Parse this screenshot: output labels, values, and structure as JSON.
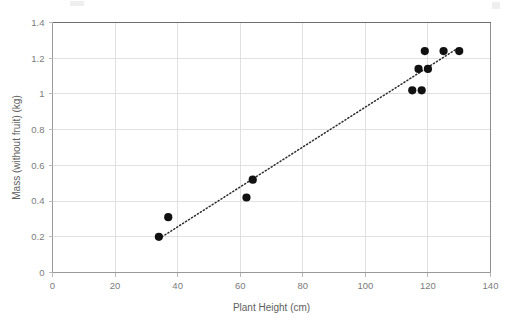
{
  "chart_data": {
    "type": "scatter",
    "title": "",
    "xlabel": "Plant Height (cm)",
    "ylabel": "Mass (without fruit) (kg)",
    "xlim": [
      0,
      140
    ],
    "ylim": [
      0,
      1.4
    ],
    "xticks": [
      "0",
      "20",
      "40",
      "60",
      "80",
      "100",
      "120",
      "140"
    ],
    "xtick_values": [
      0,
      20,
      40,
      60,
      80,
      100,
      120,
      140
    ],
    "yticks": [
      "0",
      "0.2",
      "0.4",
      "0.6",
      "0.8",
      "1",
      "1.2",
      "1.4"
    ],
    "ytick_values": [
      0,
      0.2,
      0.4,
      0.6,
      0.8,
      1.0,
      1.2,
      1.4
    ],
    "grid": "horizontal-and-vertical",
    "legend": "none",
    "marker": "filled-circle",
    "marker_color": "#111111",
    "points": [
      {
        "x": 34,
        "y": 0.2
      },
      {
        "x": 37,
        "y": 0.31
      },
      {
        "x": 62,
        "y": 0.42
      },
      {
        "x": 64,
        "y": 0.52
      },
      {
        "x": 115,
        "y": 1.02
      },
      {
        "x": 118,
        "y": 1.02
      },
      {
        "x": 117,
        "y": 1.14
      },
      {
        "x": 120,
        "y": 1.14
      },
      {
        "x": 119,
        "y": 1.24
      },
      {
        "x": 125,
        "y": 1.24
      },
      {
        "x": 130,
        "y": 1.24
      }
    ],
    "trendline": {
      "style": "dotted",
      "color": "#2b2b2b",
      "x0": 35,
      "y0": 0.2,
      "x1": 129,
      "y1": 1.25
    }
  }
}
